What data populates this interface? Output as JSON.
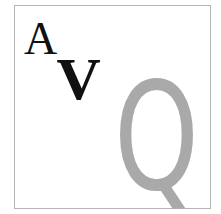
{
  "glyphs": {
    "a": "A",
    "v": "V",
    "q": "Q"
  },
  "colors": {
    "serif_letters": "#111111",
    "q_letter": "#a9a9a9",
    "border": "#b5b5b5"
  }
}
